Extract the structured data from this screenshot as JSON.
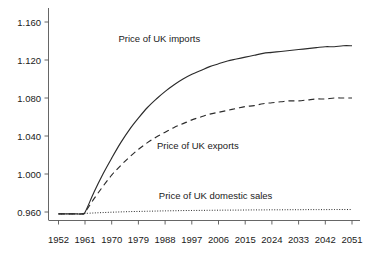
{
  "chart_data": {
    "type": "line",
    "title": "",
    "subtitle": "",
    "xlabel": "",
    "ylabel": "",
    "grid": false,
    "legend_position": "inline-annotations",
    "xlim": [
      1952,
      2051
    ],
    "ylim": [
      0.94,
      1.17
    ],
    "x_ticks": [
      "1952",
      "1961",
      "1970",
      "1979",
      "1988",
      "1997",
      "2006",
      "2015",
      "2024",
      "2033",
      "2042",
      "2051"
    ],
    "y_ticks": [
      "0.960",
      "1.000",
      "1.040",
      "1.080",
      "1.120",
      "1.160"
    ],
    "x": [
      1952,
      1955,
      1958,
      1960,
      1961,
      1964,
      1967,
      1970,
      1973,
      1976,
      1979,
      1982,
      1985,
      1988,
      1991,
      1994,
      1997,
      2000,
      2003,
      2006,
      2009,
      2012,
      2015,
      2018,
      2021,
      2024,
      2027,
      2030,
      2033,
      2036,
      2039,
      2042,
      2045,
      2048,
      2051
    ],
    "series": [
      {
        "name": "Price of UK imports",
        "style": "solid",
        "color": "#2b2b2b",
        "values": [
          0.958,
          0.958,
          0.958,
          0.958,
          0.96,
          0.981,
          1.0,
          1.017,
          1.033,
          1.047,
          1.059,
          1.07,
          1.079,
          1.087,
          1.094,
          1.1,
          1.105,
          1.109,
          1.113,
          1.116,
          1.119,
          1.121,
          1.123,
          1.125,
          1.127,
          1.128,
          1.129,
          1.13,
          1.131,
          1.132,
          1.133,
          1.134,
          1.134,
          1.135,
          1.135
        ]
      },
      {
        "name": "Price of UK exports",
        "style": "dashed",
        "color": "#2b2b2b",
        "values": [
          0.958,
          0.958,
          0.958,
          0.958,
          0.96,
          0.974,
          0.987,
          0.999,
          1.009,
          1.018,
          1.026,
          1.033,
          1.039,
          1.044,
          1.049,
          1.053,
          1.057,
          1.06,
          1.063,
          1.065,
          1.067,
          1.069,
          1.071,
          1.072,
          1.074,
          1.075,
          1.076,
          1.077,
          1.077,
          1.078,
          1.079,
          1.079,
          1.08,
          1.08,
          1.08
        ]
      },
      {
        "name": "Price of UK domestic sales",
        "style": "dotted",
        "color": "#2b2b2b",
        "values": [
          0.958,
          0.958,
          0.958,
          0.958,
          0.9585,
          0.959,
          0.9594,
          0.9598,
          0.9601,
          0.9604,
          0.9606,
          0.9608,
          0.961,
          0.9612,
          0.9613,
          0.9615,
          0.9616,
          0.9617,
          0.9618,
          0.9619,
          0.962,
          0.962,
          0.9621,
          0.9622,
          0.9622,
          0.9623,
          0.9623,
          0.9624,
          0.9624,
          0.9625,
          0.9625,
          0.9625,
          0.9626,
          0.9626,
          0.9626
        ]
      }
    ],
    "annotations": [
      {
        "text": "Price of UK imports",
        "x": 1986,
        "y": 1.139
      },
      {
        "text": "Price of UK exports",
        "x": 1999,
        "y": 1.026
      },
      {
        "text": "Price of UK domestic sales",
        "x": 2005,
        "y": 0.974
      }
    ]
  },
  "axis": {
    "y_tick_0": "0.960",
    "y_tick_1": "1.000",
    "y_tick_2": "1.040",
    "y_tick_3": "1.080",
    "y_tick_4": "1.120",
    "y_tick_5": "1.160",
    "x_tick_0": "1952",
    "x_tick_1": "1961",
    "x_tick_2": "1970",
    "x_tick_3": "1979",
    "x_tick_4": "1988",
    "x_tick_5": "1997",
    "x_tick_6": "2006",
    "x_tick_7": "2015",
    "x_tick_8": "2024",
    "x_tick_9": "2033",
    "x_tick_10": "2042",
    "x_tick_11": "2051"
  },
  "labels": {
    "imports": "Price of UK imports",
    "exports": "Price of UK exports",
    "domestic": "Price of UK domestic sales"
  },
  "colors": {
    "background": "#ffffff",
    "axis": "#555555",
    "curve": "#2b2b2b",
    "text": "#1a1a1a"
  }
}
